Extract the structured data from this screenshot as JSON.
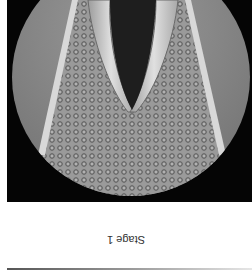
{
  "figure": {
    "orientation": "rotated 180 degrees",
    "caption": "Stage 1"
  },
  "colors": {
    "background": "#ffffff",
    "panel": "#050505",
    "tissue": "#8a8a8a",
    "glottis": "#1e1e1e",
    "cords": "#c8c8c8"
  }
}
